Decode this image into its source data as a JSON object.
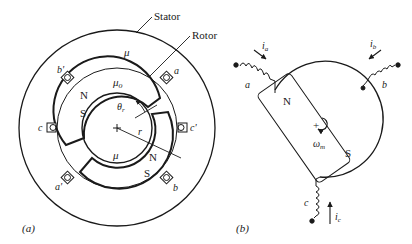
{
  "figure": {
    "panel_a": {
      "caption": "(a)",
      "labels": {
        "stator": "Stator",
        "rotor": "Rotor",
        "mu_stator": "μ",
        "mu_gap": "μ",
        "mu_gap_sub": "o",
        "mu_rotor": "μ",
        "theta": "θ",
        "theta_sub": "r",
        "radius": "r",
        "north_top": "N",
        "south_top": "S",
        "north_bottom": "N",
        "south_bottom": "S",
        "coil_a": "a",
        "coil_a_prime": "a'",
        "coil_b": "b",
        "coil_b_prime": "b'",
        "coil_c": "c",
        "coil_c_prime": "c'"
      }
    },
    "panel_b": {
      "caption": "(b)",
      "labels": {
        "winding_a": "a",
        "winding_b": "b",
        "winding_c": "c",
        "current_a": "i",
        "current_a_sub": "a",
        "current_b": "i",
        "current_b_sub": "b",
        "current_c": "i",
        "current_c_sub": "c",
        "north": "N",
        "south": "S",
        "plus": "+",
        "omega": "ω",
        "omega_sub": "m"
      }
    }
  },
  "colors": {
    "ink": "#1a1a1a",
    "background": "#ffffff"
  }
}
